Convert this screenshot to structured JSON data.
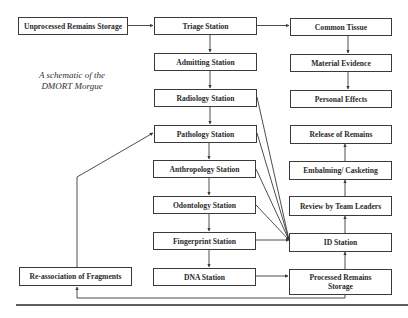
{
  "caption": {
    "line1": "A schematic of the",
    "line2": "DMORT Morgue"
  },
  "colors": {
    "line": "#3a3a3a",
    "text": "#2a2a2a",
    "background": "#ffffff"
  },
  "nodes": {
    "unprocessed": {
      "label": "Unprocessed Remains Storage",
      "x": 18,
      "y": 17,
      "w": 110,
      "h": 18
    },
    "triage": {
      "label": "Triage Station",
      "x": 154,
      "y": 17,
      "w": 103,
      "h": 18
    },
    "admitting": {
      "label": "Admitting Station",
      "x": 154,
      "y": 53,
      "w": 103,
      "h": 18
    },
    "radiology": {
      "label": "Radiology Station",
      "x": 154,
      "y": 89,
      "w": 103,
      "h": 18
    },
    "pathology": {
      "label": "Pathology Station",
      "x": 154,
      "y": 125,
      "w": 103,
      "h": 18
    },
    "anthropology": {
      "label": "Anthropology Station",
      "x": 153,
      "y": 160,
      "w": 103,
      "h": 18
    },
    "odontology": {
      "label": "Odontology Station",
      "x": 153,
      "y": 196,
      "w": 103,
      "h": 18
    },
    "fingerprint": {
      "label": "Fingerprint Station",
      "x": 153,
      "y": 232,
      "w": 103,
      "h": 18
    },
    "dna": {
      "label": "DNA Station",
      "x": 153,
      "y": 268,
      "w": 103,
      "h": 18
    },
    "reassociation": {
      "label": "Re-association of Fragments",
      "x": 19,
      "y": 267,
      "w": 113,
      "h": 19
    },
    "common_tissue": {
      "label": "Common Tissue",
      "x": 290,
      "y": 18,
      "w": 102,
      "h": 18
    },
    "material_evidence": {
      "label": "Material Evidence",
      "x": 290,
      "y": 54,
      "w": 102,
      "h": 18
    },
    "personal_effects": {
      "label": "Personal Effects",
      "x": 290,
      "y": 90,
      "w": 102,
      "h": 18
    },
    "release": {
      "label": "Release of Remains",
      "x": 290,
      "y": 125,
      "w": 102,
      "h": 18
    },
    "embalming": {
      "label": "Embalming/ Casketing",
      "x": 289,
      "y": 161,
      "w": 103,
      "h": 18
    },
    "review": {
      "label": "Review by Team Leaders",
      "x": 289,
      "y": 196,
      "w": 103,
      "h": 19
    },
    "id_station": {
      "label": "ID Station",
      "x": 289,
      "y": 233,
      "w": 103,
      "h": 18
    },
    "processed": {
      "label": "Processed Remains Storage",
      "x": 289,
      "y": 269,
      "w": 103,
      "h": 26
    }
  },
  "edges": [
    {
      "from": "Unprocessed Remains Storage",
      "to": "Triage Station"
    },
    {
      "from": "Triage Station",
      "to": "Common Tissue"
    },
    {
      "from": "Triage Station",
      "to": "Admitting Station"
    },
    {
      "from": "Admitting Station",
      "to": "Radiology Station"
    },
    {
      "from": "Radiology Station",
      "to": "Pathology Station"
    },
    {
      "from": "Pathology Station",
      "to": "Anthropology Station"
    },
    {
      "from": "Anthropology Station",
      "to": "Odontology Station"
    },
    {
      "from": "Odontology Station",
      "to": "Fingerprint Station"
    },
    {
      "from": "Fingerprint Station",
      "to": "DNA Station"
    },
    {
      "from": "Common Tissue",
      "to": "Material Evidence"
    },
    {
      "from": "Material Evidence",
      "to": "Personal Effects"
    },
    {
      "from": "Radiology Station",
      "to": "ID Station"
    },
    {
      "from": "Pathology Station",
      "to": "ID Station"
    },
    {
      "from": "Anthropology Station",
      "to": "ID Station"
    },
    {
      "from": "Odontology Station",
      "to": "ID Station"
    },
    {
      "from": "Fingerprint Station",
      "to": "ID Station"
    },
    {
      "from": "DNA Station",
      "to": "Processed Remains Storage"
    },
    {
      "from": "Processed Remains Storage",
      "to": "ID Station"
    },
    {
      "from": "ID Station",
      "to": "Review by Team Leaders"
    },
    {
      "from": "Review by Team Leaders",
      "to": "Embalming/ Casketing"
    },
    {
      "from": "Embalming/ Casketing",
      "to": "Release of Remains"
    },
    {
      "from": "Processed Remains Storage",
      "to": "Re-association of Fragments"
    },
    {
      "from": "Re-association of Fragments",
      "to": "Pathology Station"
    }
  ]
}
